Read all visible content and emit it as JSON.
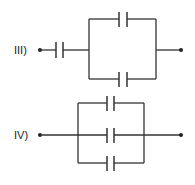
{
  "circuits": [
    {
      "label": "III)",
      "description": "One capacitor in series with two capacitors in parallel",
      "series_capacitors": 1,
      "parallel_capacitors": 2
    },
    {
      "label": "IV)",
      "description": "Three capacitors in parallel",
      "series_capacitors": 0,
      "parallel_capacitors": 3
    }
  ],
  "colors": {
    "line": "#333333",
    "background": "#ffffff"
  }
}
